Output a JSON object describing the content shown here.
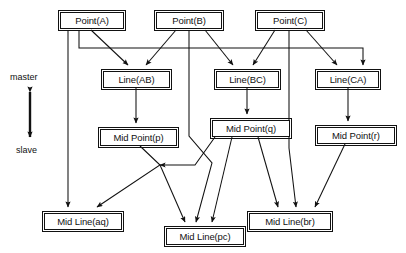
{
  "diagram": {
    "background_color": "#ffffff",
    "line_color": "#111111",
    "legend": {
      "top_label": "master",
      "bottom_label": "slave",
      "arrow_icon": "double-headed-vertical-arrow-icon"
    },
    "nodes": [
      {
        "id": "point_a",
        "label": "Point(A)",
        "x": 60,
        "y": 12,
        "w": 64,
        "h": 17
      },
      {
        "id": "point_b",
        "label": "Point(B)",
        "x": 156,
        "y": 12,
        "w": 66,
        "h": 17
      },
      {
        "id": "point_c",
        "label": "Point(C)",
        "x": 257,
        "y": 12,
        "w": 66,
        "h": 17
      },
      {
        "id": "line_ab",
        "label": "Line(AB)",
        "x": 103,
        "y": 71,
        "w": 67,
        "h": 17
      },
      {
        "id": "line_bc",
        "label": "Line(BC)",
        "x": 216,
        "y": 71,
        "w": 63,
        "h": 17
      },
      {
        "id": "line_ca",
        "label": "Line(CA)",
        "x": 317,
        "y": 71,
        "w": 62,
        "h": 17
      },
      {
        "id": "mid_point_p",
        "label": "Mid Point(p)",
        "x": 100,
        "y": 129,
        "w": 77,
        "h": 17
      },
      {
        "id": "mid_point_q",
        "label": "Mid Point(q)",
        "x": 212,
        "y": 120,
        "w": 78,
        "h": 17
      },
      {
        "id": "mid_point_r",
        "label": "Mid Point(r)",
        "x": 317,
        "y": 127,
        "w": 78,
        "h": 17
      },
      {
        "id": "mid_line_aq",
        "label": "Mid Line(aq)",
        "x": 44,
        "y": 213,
        "w": 78,
        "h": 17
      },
      {
        "id": "mid_line_pc",
        "label": "Mid Line(pc)",
        "x": 166,
        "y": 228,
        "w": 78,
        "h": 17
      },
      {
        "id": "mid_line_br",
        "label": "Mid Line(br)",
        "x": 249,
        "y": 213,
        "w": 82,
        "h": 17
      }
    ],
    "edges": [
      {
        "id": "a-to-ab",
        "from": "point_a",
        "to": "line_ab",
        "type": "diagonal"
      },
      {
        "id": "a-to-aq",
        "from": "point_a",
        "to": "mid_line_aq",
        "type": "vertical"
      },
      {
        "id": "a-to-ca",
        "from": "point_a",
        "to": "line_ca",
        "type": "orthogonal"
      },
      {
        "id": "b-to-ab",
        "from": "point_b",
        "to": "line_ab",
        "type": "diagonal"
      },
      {
        "id": "b-to-bc",
        "from": "point_b",
        "to": "line_bc",
        "type": "diagonal"
      },
      {
        "id": "b-to-pc",
        "from": "point_b",
        "to": "mid_line_pc",
        "type": "orthogonal"
      },
      {
        "id": "c-to-bc",
        "from": "point_c",
        "to": "line_bc",
        "type": "diagonal"
      },
      {
        "id": "c-to-ca",
        "from": "point_c",
        "to": "line_ca",
        "type": "diagonal"
      },
      {
        "id": "c-to-br",
        "from": "point_c",
        "to": "mid_line_br",
        "type": "orthogonal"
      },
      {
        "id": "ab-to-p",
        "from": "line_ab",
        "to": "mid_point_p",
        "type": "vertical"
      },
      {
        "id": "bc-to-q",
        "from": "line_bc",
        "to": "mid_point_q",
        "type": "vertical"
      },
      {
        "id": "ca-to-r",
        "from": "line_ca",
        "to": "mid_point_r",
        "type": "vertical"
      },
      {
        "id": "p-to-aq",
        "from": "mid_point_p",
        "to": "mid_line_aq",
        "type": "orthogonal"
      },
      {
        "id": "p-to-pc",
        "from": "mid_point_p",
        "to": "mid_line_pc",
        "type": "orthogonal"
      },
      {
        "id": "q-to-aq",
        "from": "mid_point_q",
        "to": "mid_line_aq",
        "type": "orthogonal"
      },
      {
        "id": "q-to-pc",
        "from": "mid_point_q",
        "to": "mid_line_pc",
        "type": "diagonal"
      },
      {
        "id": "q-to-br",
        "from": "mid_point_q",
        "to": "mid_line_br",
        "type": "diagonal"
      },
      {
        "id": "r-to-br",
        "from": "mid_point_r",
        "to": "mid_line_br",
        "type": "diagonal"
      }
    ]
  }
}
